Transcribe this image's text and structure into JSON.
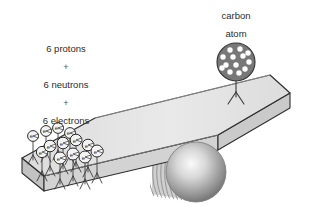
{
  "figure": {
    "title_alt": "carbon atom balance illustration",
    "background_color": "#ffffff"
  },
  "labels": {
    "left_stack": [
      {
        "text": "6 protons",
        "x": 66,
        "y": 52
      },
      {
        "text": "+",
        "x": 66,
        "y": 70
      },
      {
        "text": "6 neutrons",
        "x": 66,
        "y": 88
      },
      {
        "text": "+",
        "x": 66,
        "y": 106
      },
      {
        "text": "6 electrons",
        "x": 66,
        "y": 124
      }
    ],
    "right_stack": [
      {
        "text": "carbon",
        "x": 236,
        "y": 19
      },
      {
        "text": "atom",
        "x": 236,
        "y": 37
      }
    ]
  },
  "colors": {
    "text": "#2b2b2b",
    "plus": "#555555",
    "plank_top": "#e4e4e4",
    "plank_front": "#d2d2d2",
    "plank_side": "#c6c6c6",
    "plank_outline": "#2f2f2f",
    "atom_fill": "#777777",
    "atom_dot": "#ffffff",
    "atom_outline": "#333333",
    "electron_fill": "#f2f2f2",
    "electron_outline": "#2b2b2b",
    "sphere_light": "#f4f4f4",
    "sphere_mid": "#a8a8a8",
    "sphere_dark": "#707070",
    "cylinder_stripe": "#8f8f8f",
    "stick_figure": "#3a3a3a"
  },
  "atom": {
    "name": "carbon-atom",
    "circle": {
      "cx": 236,
      "cy": 62,
      "r": 19
    },
    "nucleon_count": 13,
    "nucleons": [
      {
        "cx": 230,
        "cy": 50,
        "r": 2.6
      },
      {
        "cx": 240,
        "cy": 49,
        "r": 2.6
      },
      {
        "cx": 223,
        "cy": 56,
        "r": 2.6
      },
      {
        "cx": 233,
        "cy": 57,
        "r": 2.6
      },
      {
        "cx": 243,
        "cy": 56,
        "r": 2.6
      },
      {
        "cx": 249,
        "cy": 61,
        "r": 2.6
      },
      {
        "cx": 226,
        "cy": 64,
        "r": 2.6
      },
      {
        "cx": 236,
        "cy": 64,
        "r": 2.6
      },
      {
        "cx": 245,
        "cy": 68,
        "r": 2.6
      },
      {
        "cx": 230,
        "cy": 71,
        "r": 2.6
      },
      {
        "cx": 239,
        "cy": 72,
        "r": 2.6
      },
      {
        "cx": 223,
        "cy": 68,
        "r": 2.6
      },
      {
        "cx": 248,
        "cy": 53,
        "r": 2.6
      }
    ],
    "body": {
      "x1": 236,
      "y1": 81,
      "x2": 236,
      "y2": 99
    },
    "legs": [
      {
        "x1": 236,
        "y1": 95,
        "x2": 228,
        "y2": 107
      },
      {
        "x1": 236,
        "y1": 95,
        "x2": 244,
        "y2": 107
      }
    ]
  },
  "electrons": {
    "name": "electron-crowd",
    "letter": "e",
    "count": 13,
    "items": [
      {
        "cx": 33,
        "cy": 136,
        "r": 5.4,
        "foot_y": 163
      },
      {
        "cx": 46,
        "cy": 131,
        "r": 5.4,
        "foot_y": 161
      },
      {
        "cx": 58,
        "cy": 128,
        "r": 5.4,
        "foot_y": 159
      },
      {
        "cx": 70,
        "cy": 133,
        "r": 5.4,
        "foot_y": 165
      },
      {
        "cx": 50,
        "cy": 146,
        "r": 5.8,
        "foot_y": 176
      },
      {
        "cx": 63,
        "cy": 143,
        "r": 5.8,
        "foot_y": 174
      },
      {
        "cx": 76,
        "cy": 140,
        "r": 5.8,
        "foot_y": 172
      },
      {
        "cx": 88,
        "cy": 145,
        "r": 5.8,
        "foot_y": 177
      },
      {
        "cx": 60,
        "cy": 158,
        "r": 6.0,
        "foot_y": 188
      },
      {
        "cx": 73,
        "cy": 154,
        "r": 6.0,
        "foot_y": 186
      },
      {
        "cx": 85,
        "cy": 157,
        "r": 6.0,
        "foot_y": 189
      },
      {
        "cx": 97,
        "cy": 151,
        "r": 6.0,
        "foot_y": 183
      },
      {
        "cx": 42,
        "cy": 152,
        "r": 5.6,
        "foot_y": 181
      }
    ]
  },
  "plank": {
    "name": "balance-plank",
    "top_face": "22,158 95,118 270,75 290,93 218,135 44,176",
    "front_face": "22,158 44,176 44,190 22,172",
    "long_front": "44,176 218,135 218,149 44,190",
    "right_end": "218,135 290,93 290,107 218,149"
  },
  "fulcrum": {
    "name": "fulcrum-cylinder",
    "sphere": {
      "cx": 196,
      "cy": 172,
      "r": 30
    },
    "cylinder_left_x": 150,
    "stripe_count": 11
  }
}
